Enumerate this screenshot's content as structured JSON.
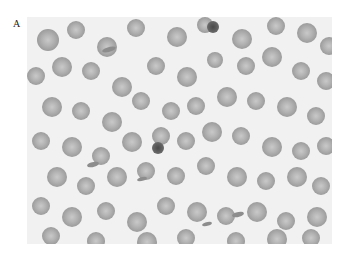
{
  "figure": {
    "panel_label": "A",
    "cells": [
      [
        10,
        12,
        22
      ],
      [
        40,
        4,
        18
      ],
      [
        70,
        20,
        20
      ],
      [
        100,
        2,
        18
      ],
      [
        140,
        10,
        20
      ],
      [
        170,
        0,
        16
      ],
      [
        205,
        12,
        20
      ],
      [
        240,
        0,
        18
      ],
      [
        270,
        6,
        20
      ],
      [
        293,
        20,
        18
      ],
      [
        0,
        50,
        18
      ],
      [
        25,
        40,
        20
      ],
      [
        55,
        45,
        18
      ],
      [
        85,
        60,
        20
      ],
      [
        120,
        40,
        18
      ],
      [
        150,
        50,
        20
      ],
      [
        180,
        35,
        16
      ],
      [
        210,
        40,
        18
      ],
      [
        235,
        30,
        20
      ],
      [
        265,
        45,
        18
      ],
      [
        290,
        55,
        18
      ],
      [
        15,
        80,
        20
      ],
      [
        45,
        85,
        18
      ],
      [
        75,
        95,
        20
      ],
      [
        105,
        75,
        18
      ],
      [
        135,
        85,
        18
      ],
      [
        160,
        80,
        18
      ],
      [
        190,
        70,
        20
      ],
      [
        220,
        75,
        18
      ],
      [
        250,
        80,
        20
      ],
      [
        280,
        90,
        18
      ],
      [
        5,
        115,
        18
      ],
      [
        35,
        120,
        20
      ],
      [
        65,
        130,
        18
      ],
      [
        95,
        115,
        20
      ],
      [
        125,
        110,
        18
      ],
      [
        150,
        115,
        18
      ],
      [
        175,
        105,
        20
      ],
      [
        205,
        110,
        18
      ],
      [
        235,
        120,
        20
      ],
      [
        265,
        125,
        18
      ],
      [
        290,
        120,
        18
      ],
      [
        20,
        150,
        20
      ],
      [
        50,
        160,
        18
      ],
      [
        80,
        150,
        20
      ],
      [
        110,
        145,
        18
      ],
      [
        140,
        150,
        18
      ],
      [
        170,
        140,
        18
      ],
      [
        200,
        150,
        20
      ],
      [
        230,
        155,
        18
      ],
      [
        260,
        150,
        20
      ],
      [
        285,
        160,
        18
      ],
      [
        5,
        180,
        18
      ],
      [
        35,
        190,
        20
      ],
      [
        70,
        185,
        18
      ],
      [
        100,
        195,
        20
      ],
      [
        130,
        180,
        18
      ],
      [
        160,
        185,
        20
      ],
      [
        190,
        190,
        18
      ],
      [
        220,
        185,
        20
      ],
      [
        250,
        195,
        18
      ],
      [
        280,
        190,
        20
      ],
      [
        15,
        210,
        18
      ],
      [
        60,
        215,
        18
      ],
      [
        110,
        215,
        20
      ],
      [
        150,
        212,
        18
      ],
      [
        200,
        215,
        18
      ],
      [
        240,
        212,
        20
      ],
      [
        275,
        212,
        18
      ]
    ],
    "dark_cells": [
      [
        125,
        125,
        12
      ],
      [
        180,
        4,
        12
      ]
    ],
    "fragments": [
      [
        75,
        30,
        14,
        5
      ],
      [
        60,
        145,
        12,
        5
      ],
      [
        205,
        195,
        12,
        5
      ],
      [
        175,
        205,
        10,
        4
      ],
      [
        110,
        160,
        10,
        4
      ]
    ]
  }
}
